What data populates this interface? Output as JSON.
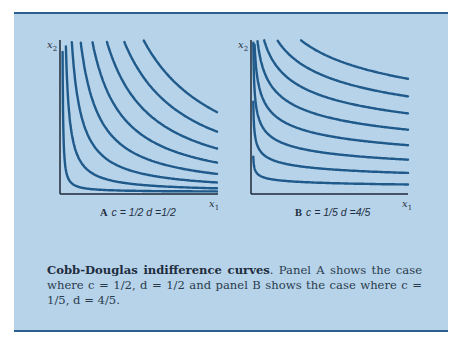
{
  "figure": {
    "background": "#b7d3ea",
    "border_color": "#2f5f8f",
    "curve_color": "#1f5a8a"
  },
  "panels": [
    {
      "id": "A",
      "letter": "A",
      "params": "c = 1/2  d =1/2",
      "x_label": "x",
      "x_sub": "1",
      "y_label": "x",
      "y_sub": "2"
    },
    {
      "id": "B",
      "letter": "B",
      "params": "c = 1/5  d =4/5",
      "x_label": "x",
      "x_sub": "1",
      "y_label": "x",
      "y_sub": "2"
    }
  ],
  "caption": {
    "title": "Cobb-Douglas indifference curves",
    "text": ". Panel A shows the case where c = 1/2, d = 1/2 and panel B shows the case where c = 1/5, d = 4/5."
  },
  "chart_data": [
    {
      "type": "line",
      "title": "A  c = 1/2 d = 1/2",
      "xlabel": "x1",
      "ylabel": "x2",
      "function": "x1^c * x2^d = u",
      "c": 0.5,
      "d": 0.5,
      "series_count": 8,
      "levels": [
        1,
        2,
        3,
        4,
        5,
        6,
        7,
        8
      ],
      "grid": false,
      "legend": "none"
    },
    {
      "type": "line",
      "title": "B  c = 1/5 d = 4/5",
      "xlabel": "x1",
      "ylabel": "x2",
      "function": "x1^c * x2^d = u",
      "c": 0.2,
      "d": 0.8,
      "series_count": 8,
      "levels": [
        1,
        2,
        3,
        4,
        5,
        6,
        7,
        8
      ],
      "grid": false,
      "legend": "none"
    }
  ]
}
